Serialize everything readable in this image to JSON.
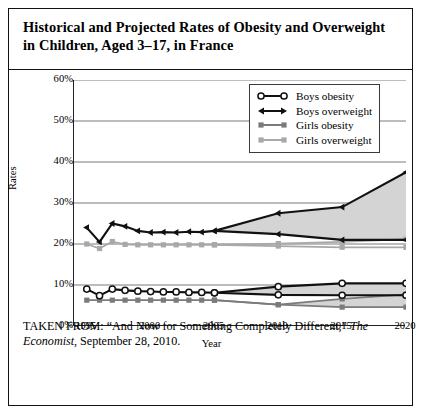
{
  "figure": {
    "title": "Historical and Projected Rates of Obesity and Overweight in Children, Aged 3–17, in France",
    "caption_part1": "TAKEN FROM: “And Now for Something Completely Different,” ",
    "caption_italic": "The Economist",
    "caption_part2": ", September 28, 2010."
  },
  "colors": {
    "boys": "#111111",
    "girls_obesity": "#7b7b7b",
    "girls_overweight": "#a8a8a8",
    "projection_band": "#d4d4d4",
    "grid": "#7a7a7a",
    "axis": "#222222",
    "frame": "#111111"
  },
  "chart_data": {
    "type": "line",
    "title": "Historical and Projected Rates of Obesity and Overweight in Children, Aged 3–17, in France",
    "xlabel": "Year",
    "ylabel": "Rates",
    "xlim": [
      1994,
      2020
    ],
    "ylim": [
      0,
      60
    ],
    "ytick_labels": [
      "0%",
      "10%",
      "20%",
      "30%",
      "40%",
      "50%",
      "60%"
    ],
    "ytick_values": [
      0,
      10,
      20,
      30,
      40,
      50,
      60
    ],
    "xtick_labels": [
      "1995",
      "2000",
      "2005",
      "2010",
      "2015",
      "2020"
    ],
    "xtick_values": [
      1995,
      2000,
      2005,
      2010,
      2015,
      2020
    ],
    "grid": true,
    "legend_position": "top-right",
    "legend": [
      "Boys obesity",
      "Boys overweight",
      "Girls obesity",
      "Girls overweight"
    ],
    "series": [
      {
        "name": "Boys overweight",
        "marker": "triangle",
        "color": "#111111",
        "x": [
          1995,
          1996,
          1997,
          1998,
          1999,
          2000,
          2001,
          2002,
          2003,
          2004,
          2005,
          2010,
          2015,
          2020
        ],
        "values": [
          24.0,
          20.5,
          25.0,
          24.3,
          23.2,
          22.8,
          22.9,
          22.8,
          23.0,
          22.9,
          23.2,
          27.5,
          29.0,
          37.5
        ]
      },
      {
        "name": "Boys overweight (low projection)",
        "marker": "triangle",
        "color": "#111111",
        "projection": true,
        "x": [
          2005,
          2010,
          2015,
          2020
        ],
        "values": [
          23.2,
          22.4,
          21.0,
          21.0
        ]
      },
      {
        "name": "Boys obesity",
        "marker": "open-circle",
        "color": "#111111",
        "x": [
          1995,
          1996,
          1997,
          1998,
          1999,
          2000,
          2001,
          2002,
          2003,
          2004,
          2005,
          2010,
          2015,
          2020
        ],
        "values": [
          9.0,
          7.4,
          9.0,
          8.7,
          8.5,
          8.4,
          8.3,
          8.3,
          8.2,
          8.2,
          8.1,
          9.6,
          10.4,
          10.4
        ]
      },
      {
        "name": "Boys obesity (low projection)",
        "marker": "open-circle",
        "color": "#111111",
        "projection": true,
        "x": [
          2005,
          2010,
          2015,
          2020
        ],
        "values": [
          8.1,
          7.6,
          7.5,
          7.5
        ]
      },
      {
        "name": "Girls overweight",
        "marker": "square",
        "color": "#a8a8a8",
        "x": [
          1995,
          1996,
          1997,
          1998,
          1999,
          2000,
          2001,
          2002,
          2003,
          2004,
          2005,
          2010,
          2015,
          2020
        ],
        "values": [
          20.0,
          18.9,
          20.6,
          19.9,
          19.8,
          19.8,
          19.8,
          19.8,
          19.8,
          19.8,
          19.8,
          20.1,
          20.5,
          21.2
        ]
      },
      {
        "name": "Girls overweight (low projection)",
        "marker": "square",
        "color": "#a8a8a8",
        "projection": true,
        "x": [
          2005,
          2010,
          2015,
          2020
        ],
        "values": [
          19.8,
          19.5,
          19.2,
          19.2
        ]
      },
      {
        "name": "Girls obesity",
        "marker": "square",
        "color": "#7b7b7b",
        "x": [
          1995,
          1996,
          1997,
          1998,
          1999,
          2000,
          2001,
          2002,
          2003,
          2004,
          2005,
          2010,
          2015,
          2020
        ],
        "values": [
          6.3,
          6.3,
          6.3,
          6.3,
          6.3,
          6.3,
          6.3,
          6.3,
          6.3,
          6.3,
          6.3,
          5.2,
          6.6,
          7.7
        ]
      },
      {
        "name": "Girls obesity (low projection)",
        "marker": "square",
        "color": "#7b7b7b",
        "projection": true,
        "x": [
          2005,
          2010,
          2015,
          2020
        ],
        "values": [
          6.3,
          5.2,
          4.6,
          4.6
        ]
      }
    ],
    "projection_bands": [
      {
        "name": "Boys overweight band",
        "x": [
          2005,
          2010,
          2015,
          2020
        ],
        "upper": [
          23.2,
          27.5,
          29.0,
          37.5
        ],
        "lower": [
          23.2,
          22.4,
          21.0,
          21.0
        ]
      },
      {
        "name": "Boys obesity band",
        "x": [
          2005,
          2010,
          2015,
          2020
        ],
        "upper": [
          8.1,
          9.6,
          10.4,
          10.4
        ],
        "lower": [
          8.1,
          7.6,
          7.5,
          7.5
        ]
      },
      {
        "name": "Girls band",
        "x": [
          2010,
          2015,
          2020
        ],
        "upper": [
          5.2,
          6.6,
          7.7
        ],
        "lower": [
          5.2,
          4.6,
          4.6
        ]
      }
    ]
  }
}
